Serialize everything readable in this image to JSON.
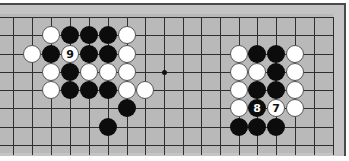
{
  "board": {
    "title": "Go diagram",
    "grid": {
      "x_lines": [
        13,
        32,
        51,
        70,
        89,
        108,
        127,
        145,
        164,
        183,
        201,
        220,
        239,
        257,
        276,
        295,
        314,
        333
      ],
      "y_lines": [
        17,
        35,
        54,
        72,
        90,
        108,
        127,
        145
      ],
      "line_top": 17,
      "line_bottom": 155,
      "line_left": 0,
      "line_right": 333
    },
    "colors": {
      "board": "#b9b9b9",
      "margin": "#c4c4c4",
      "line": "#2e2e2e",
      "black_stone": "#0c0c0c",
      "white_stone": "#ffffff"
    },
    "star_points": [
      {
        "x": 164,
        "y": 72
      }
    ],
    "stones": [
      {
        "color": "white",
        "x": 51,
        "y": 35,
        "label": ""
      },
      {
        "color": "black",
        "x": 70,
        "y": 35,
        "label": ""
      },
      {
        "color": "black",
        "x": 89,
        "y": 35,
        "label": ""
      },
      {
        "color": "black",
        "x": 108,
        "y": 35,
        "label": ""
      },
      {
        "color": "white",
        "x": 127,
        "y": 35,
        "label": ""
      },
      {
        "color": "white",
        "x": 32,
        "y": 54,
        "label": ""
      },
      {
        "color": "black",
        "x": 51,
        "y": 54,
        "label": ""
      },
      {
        "color": "white",
        "x": 70,
        "y": 54,
        "label": "9"
      },
      {
        "color": "black",
        "x": 89,
        "y": 54,
        "label": ""
      },
      {
        "color": "black",
        "x": 108,
        "y": 54,
        "label": ""
      },
      {
        "color": "white",
        "x": 127,
        "y": 54,
        "label": ""
      },
      {
        "color": "white",
        "x": 51,
        "y": 72,
        "label": ""
      },
      {
        "color": "black",
        "x": 70,
        "y": 72,
        "label": ""
      },
      {
        "color": "white",
        "x": 89,
        "y": 72,
        "label": ""
      },
      {
        "color": "white",
        "x": 108,
        "y": 72,
        "label": ""
      },
      {
        "color": "white",
        "x": 127,
        "y": 72,
        "label": ""
      },
      {
        "color": "white",
        "x": 51,
        "y": 90,
        "label": ""
      },
      {
        "color": "black",
        "x": 70,
        "y": 90,
        "label": ""
      },
      {
        "color": "black",
        "x": 89,
        "y": 90,
        "label": ""
      },
      {
        "color": "black",
        "x": 108,
        "y": 90,
        "label": ""
      },
      {
        "color": "white",
        "x": 127,
        "y": 90,
        "label": ""
      },
      {
        "color": "white",
        "x": 145,
        "y": 90,
        "label": ""
      },
      {
        "color": "black",
        "x": 127,
        "y": 108,
        "label": ""
      },
      {
        "color": "black",
        "x": 108,
        "y": 127,
        "label": ""
      },
      {
        "color": "white",
        "x": 239,
        "y": 54,
        "label": ""
      },
      {
        "color": "black",
        "x": 257,
        "y": 54,
        "label": ""
      },
      {
        "color": "black",
        "x": 276,
        "y": 54,
        "label": ""
      },
      {
        "color": "white",
        "x": 295,
        "y": 54,
        "label": ""
      },
      {
        "color": "white",
        "x": 239,
        "y": 72,
        "label": ""
      },
      {
        "color": "white",
        "x": 257,
        "y": 72,
        "label": ""
      },
      {
        "color": "black",
        "x": 276,
        "y": 72,
        "label": ""
      },
      {
        "color": "white",
        "x": 295,
        "y": 72,
        "label": ""
      },
      {
        "color": "white",
        "x": 239,
        "y": 90,
        "label": ""
      },
      {
        "color": "black",
        "x": 257,
        "y": 90,
        "label": ""
      },
      {
        "color": "black",
        "x": 276,
        "y": 90,
        "label": ""
      },
      {
        "color": "white",
        "x": 295,
        "y": 90,
        "label": ""
      },
      {
        "color": "white",
        "x": 239,
        "y": 108,
        "label": ""
      },
      {
        "color": "black",
        "x": 257,
        "y": 108,
        "label": "8"
      },
      {
        "color": "white",
        "x": 276,
        "y": 108,
        "label": "7"
      },
      {
        "color": "white",
        "x": 295,
        "y": 108,
        "label": ""
      },
      {
        "color": "black",
        "x": 239,
        "y": 127,
        "label": ""
      },
      {
        "color": "black",
        "x": 257,
        "y": 127,
        "label": ""
      },
      {
        "color": "black",
        "x": 276,
        "y": 127,
        "label": ""
      }
    ]
  }
}
